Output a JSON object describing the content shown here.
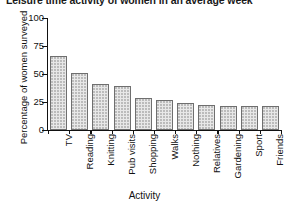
{
  "chart_data": {
    "type": "bar",
    "title": "Leisure time activity of women in an average week",
    "xlabel": "Activity",
    "ylabel": "Percentage of women surveyed",
    "categories": [
      "TV",
      "Reading",
      "Knitting",
      "Pub visits",
      "Shopping",
      "Walks",
      "Nothing",
      "Relatives",
      "Gardening",
      "Sport",
      "Friends"
    ],
    "values": [
      66,
      51,
      41,
      39,
      29,
      27,
      24,
      22,
      21,
      21,
      21
    ],
    "ylim": [
      0,
      100
    ],
    "yticks": [
      0,
      25,
      50,
      75,
      100
    ],
    "ytick_labels": [
      "0",
      "25",
      "50",
      "75",
      "100"
    ],
    "grid": false,
    "legend": false,
    "bar_fill": "#e8e8e8",
    "bar_edge": "#6f6f6f",
    "axis_color": "#111111"
  }
}
